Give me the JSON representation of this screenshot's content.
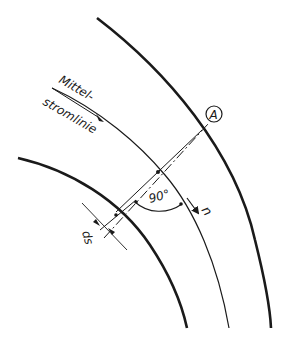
{
  "diagram": {
    "labels": {
      "streamline_line1": "Mittel-",
      "streamline_line2": "stromlinie",
      "point": "A",
      "angle": "90°",
      "normal": "n",
      "spacing": "ds"
    },
    "elements": [
      "outer-wall",
      "inner-wall",
      "middle-streamline",
      "normal-line",
      "point-A",
      "right-angle-arc",
      "normal-arrow",
      "ds-dimension"
    ],
    "colors": {
      "stroke": "#1a1a1a",
      "background": "#ffffff"
    }
  }
}
